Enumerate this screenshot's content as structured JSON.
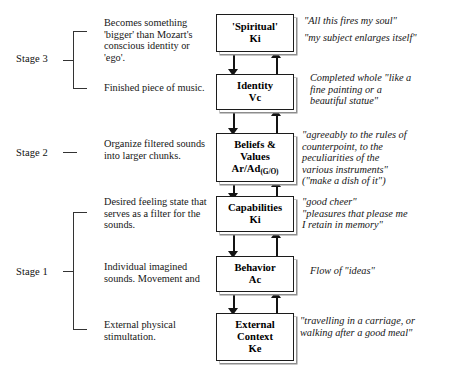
{
  "diagram": {
    "stages": [
      {
        "id": "stage-3",
        "label": "Stage 3"
      },
      {
        "id": "stage-2",
        "label": "Stage 2"
      },
      {
        "id": "stage-1",
        "label": "Stage 1"
      }
    ],
    "descriptions": [
      {
        "id": "desc-spiritual",
        "text": "Becomes something 'bigger' than Mozart's conscious identity or 'ego'."
      },
      {
        "id": "desc-identity",
        "text": "Finished piece of music."
      },
      {
        "id": "desc-beliefs",
        "text": "Organize filtered sounds into larger chunks."
      },
      {
        "id": "desc-capabilities",
        "text": "Desired feeling state that serves as a filter for the sounds."
      },
      {
        "id": "desc-behavior",
        "text": "Individual imagined sounds. Movement and"
      },
      {
        "id": "desc-context",
        "text": "External physical stimultation."
      }
    ],
    "levels": [
      {
        "id": "spiritual",
        "name": "'Spiritual'",
        "code": "Ki",
        "code_sub": ""
      },
      {
        "id": "identity",
        "name": "Identity",
        "code": "Vc",
        "code_sub": ""
      },
      {
        "id": "beliefs",
        "name": "Beliefs &",
        "name2": "Values",
        "code": "Ar/Ad",
        "code_sub": "(G/O)"
      },
      {
        "id": "capabilities",
        "name": "Capabilities",
        "code": "Ki",
        "code_sub": ""
      },
      {
        "id": "behavior",
        "name": "Behavior",
        "code": "Ac",
        "code_sub": ""
      },
      {
        "id": "context",
        "name": "External",
        "name2": "Context",
        "code": "Ke",
        "code_sub": ""
      }
    ],
    "quotes": [
      {
        "id": "quote-spiritual",
        "line1": "\"All this fires my soul\"",
        "line2": "\"my subject enlarges itself\""
      },
      {
        "id": "quote-identity",
        "line1": "Completed whole \"like a",
        "line2": "fine painting or a",
        "line3": "beautiful statue\""
      },
      {
        "id": "quote-beliefs",
        "line1": "\"agreeably to the rules of",
        "line2": "counterpoint, to the",
        "line3": "peculiarities of the",
        "line4": "various instruments\"",
        "line5": "(\"make a dish of it\")"
      },
      {
        "id": "quote-capabilities",
        "line1": "\"good cheer\"",
        "line2": "\"pleasures that please me",
        "line3": "I retain in memory\""
      },
      {
        "id": "quote-behavior",
        "line1": "Flow of \"ideas\""
      },
      {
        "id": "quote-context",
        "line1": "\"travelling in a carriage, or",
        "line2": "walking after a good meal\""
      }
    ],
    "colors": {
      "box_border": "#1c1c1c",
      "box_shadow": "#8d8d8d",
      "arrow": "#141414",
      "text": "#161616",
      "bracket": "#333333"
    }
  }
}
